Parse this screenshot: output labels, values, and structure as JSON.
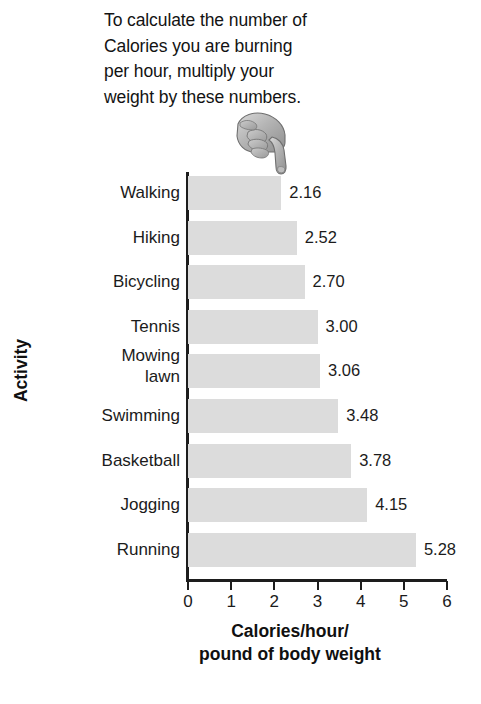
{
  "caption": {
    "lines": [
      "To calculate the number of",
      "Calories you are burning",
      "per hour, multiply your",
      "weight by these numbers."
    ]
  },
  "pointer": {
    "icon": "pointing-hand-icon",
    "direction": "down-right"
  },
  "chart_data": {
    "type": "bar",
    "orientation": "horizontal",
    "title": "",
    "xlabel_lines": [
      "Calories/hour/",
      "pound of body weight"
    ],
    "xlabel": "Calories/hour/pound of body weight",
    "ylabel": "Activity",
    "categories": [
      "Walking",
      "Hiking",
      "Bicycling",
      "Tennis",
      "Mowing lawn",
      "Swimming",
      "Basketball",
      "Jogging",
      "Running"
    ],
    "values": [
      2.16,
      2.52,
      2.7,
      3.0,
      3.06,
      3.48,
      3.78,
      4.15,
      5.28
    ],
    "value_labels": [
      "2.16",
      "2.52",
      "2.70",
      "3.00",
      "3.06",
      "3.48",
      "3.78",
      "4.15",
      "5.28"
    ],
    "xlim": [
      0,
      6
    ],
    "xticks": [
      0,
      1,
      2,
      3,
      4,
      5,
      6
    ],
    "xtick_labels": [
      "0",
      "1",
      "2",
      "3",
      "4",
      "5",
      "6"
    ],
    "grid": false,
    "legend": false,
    "bar_color": "#dcdcdc",
    "axis_color": "#1d1d1d",
    "text_color": "#1b1b1b"
  }
}
